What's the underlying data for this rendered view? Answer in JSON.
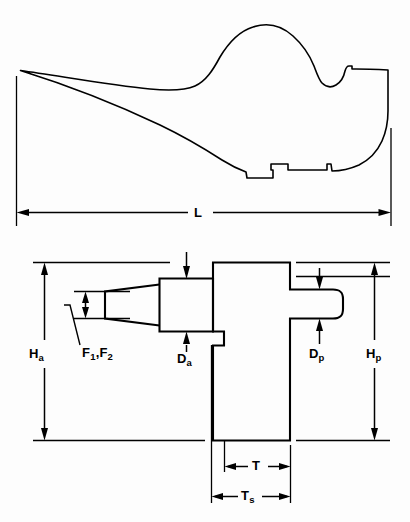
{
  "figure": {
    "type": "engineering-dimension-drawing",
    "title": "",
    "views": [
      {
        "name": "side-profile-view",
        "description": "curved horn / anvil-like side profile outline",
        "dimensions": [
          {
            "id": "L",
            "label": "L",
            "sub": "",
            "orientation": "horizontal",
            "meaning": "overall length"
          }
        ]
      },
      {
        "name": "plan-view",
        "description": "tapered horn with central body block and rounded pein protrusion",
        "dimensions": [
          {
            "id": "Ha",
            "label": "H",
            "sub": "a",
            "orientation": "vertical",
            "meaning": "anvil height"
          },
          {
            "id": "Hp",
            "label": "H",
            "sub": "p",
            "orientation": "vertical",
            "meaning": "pein height"
          },
          {
            "id": "Da",
            "label": "D",
            "sub": "a",
            "orientation": "vertical",
            "meaning": "anvil depth"
          },
          {
            "id": "Dp",
            "label": "D",
            "sub": "p",
            "orientation": "vertical",
            "meaning": "pein depth"
          },
          {
            "id": "F",
            "label": "F",
            "sub": "1",
            "label2": "F",
            "sub2": "2",
            "orientation": "vertical",
            "meaning": "horn faces"
          },
          {
            "id": "T",
            "label": "T",
            "sub": "",
            "orientation": "horizontal",
            "meaning": "thickness"
          },
          {
            "id": "Ts",
            "label": "T",
            "sub": "s",
            "orientation": "horizontal",
            "meaning": "shank thickness"
          }
        ]
      }
    ]
  },
  "labels": {
    "L": "L",
    "Ha_main": "H",
    "Ha_sub": "a",
    "Hp_main": "H",
    "Hp_sub": "p",
    "Da_main": "D",
    "Da_sub": "a",
    "Dp_main": "D",
    "Dp_sub": "p",
    "F1_main": "F",
    "F1_sub": "1",
    "F_sep": ",",
    "F2_main": "F",
    "F2_sub": "2",
    "T": "T",
    "Ts_main": "T",
    "Ts_sub": "s"
  },
  "colors": {
    "background": "#fdfdfd",
    "line": "#000000",
    "text": "#000000"
  }
}
